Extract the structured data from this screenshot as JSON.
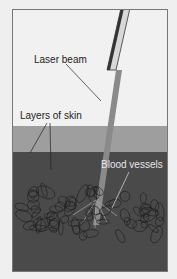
{
  "figure": {
    "labels": {
      "laser_beam": "Laser beam",
      "layers_of_skin": "Layers of skin",
      "blood_vessels": "Blood vessels"
    },
    "colors": {
      "background": "#f1f1f1",
      "upper_skin": "#9e9e9e",
      "lower_skin": "#4a4a4a",
      "beam": "#8a8a8a",
      "vessels": "#1e1e1e"
    }
  }
}
